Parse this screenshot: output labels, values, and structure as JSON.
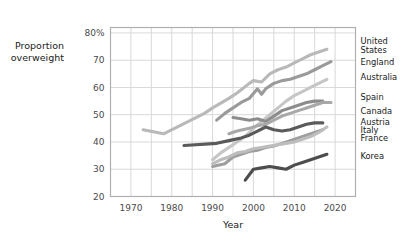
{
  "chart_data": {
    "type": "line",
    "title": "",
    "xlabel": "Year",
    "ylabel": "Proportion overweight",
    "ylabel_line1": "Proportion",
    "ylabel_line2": "overweight",
    "xlim": [
      1965,
      2025
    ],
    "ylim": [
      20,
      82
    ],
    "xticks": [
      1970,
      1980,
      1990,
      2000,
      2010,
      2020
    ],
    "xtick_labels": [
      "1970",
      "1980",
      "1990",
      "2000",
      "2010",
      "2020"
    ],
    "yticks": [
      20,
      30,
      40,
      50,
      60,
      70,
      80
    ],
    "ytick_labels": [
      "20",
      "30",
      "40",
      "50",
      "60",
      "70",
      "80%"
    ],
    "grid": true,
    "grid_minor_x": [
      1965,
      1970,
      1975,
      1980,
      1985,
      1990,
      1995,
      2000,
      2005,
      2010,
      2015,
      2020,
      2025
    ],
    "legend_position": "right-of-axes-at-line-end",
    "series": [
      {
        "name": "United States",
        "label_lines": [
          "United",
          "States"
        ],
        "color": "#b9b9b9",
        "label_y": 75.5,
        "x": [
          1973,
          1978,
          1988,
          1990,
          1994,
          1996,
          1999,
          2000,
          2002,
          2004,
          2006,
          2008,
          2010,
          2012,
          2014,
          2016,
          2018
        ],
        "values": [
          44.5,
          43.0,
          50.5,
          52.5,
          56.0,
          58.0,
          61.5,
          62.5,
          62.0,
          65.0,
          66.5,
          67.5,
          69.0,
          70.5,
          72.0,
          73.0,
          74.0
        ]
      },
      {
        "name": "England",
        "label_lines": [
          "England"
        ],
        "color": "#9a9a9a",
        "label_y": 69.5,
        "x": [
          1991,
          1993,
          1995,
          1997,
          1999,
          2001,
          2002,
          2003,
          2005,
          2007,
          2009,
          2011,
          2013,
          2015,
          2017,
          2019
        ],
        "values": [
          48.0,
          50.5,
          52.5,
          54.5,
          56.0,
          59.5,
          57.5,
          59.5,
          61.5,
          62.5,
          63.0,
          64.0,
          65.0,
          66.5,
          68.0,
          69.5
        ]
      },
      {
        "name": "Australia",
        "label_lines": [
          "Australia"
        ],
        "color": "#c6c6c6",
        "label_y": 64.0,
        "x": [
          1990,
          1992,
          1995,
          1998,
          2000,
          2002,
          2004,
          2006,
          2008,
          2010,
          2012,
          2014,
          2016,
          2018
        ],
        "values": [
          33.5,
          36.0,
          39.0,
          42.0,
          45.0,
          47.5,
          50.0,
          52.5,
          55.0,
          57.0,
          58.5,
          60.0,
          61.5,
          63.0
        ]
      },
      {
        "name": "Spain",
        "label_lines": [
          "Spain"
        ],
        "color": "#8c8c8c",
        "label_y": 56.5,
        "x": [
          1995,
          1997,
          1999,
          2001,
          2003,
          2005,
          2007,
          2009,
          2011,
          2013,
          2015,
          2017
        ],
        "values": [
          49.0,
          48.5,
          48.0,
          48.5,
          47.5,
          49.5,
          51.5,
          52.5,
          53.5,
          54.5,
          55.0,
          55.0
        ]
      },
      {
        "name": "Canada",
        "label_lines": [
          "Canada"
        ],
        "color": "#a8a8a8",
        "label_y": 51.5,
        "x": [
          1994,
          1996,
          1999,
          2001,
          2003,
          2005,
          2007,
          2009,
          2011,
          2013,
          2015,
          2017,
          2019
        ],
        "values": [
          43.0,
          44.0,
          45.0,
          46.0,
          46.5,
          48.0,
          49.5,
          50.5,
          51.5,
          52.5,
          53.5,
          54.5,
          54.5
        ]
      },
      {
        "name": "Austria",
        "label_lines": [
          "Austria"
        ],
        "color": "#5a5a5a",
        "label_y": 47.5,
        "x": [
          1983,
          1991,
          1994,
          1997,
          1999,
          2001,
          2003,
          2005,
          2007,
          2009,
          2011,
          2013,
          2015,
          2017
        ],
        "values": [
          38.7,
          39.5,
          40.5,
          41.5,
          42.5,
          44.0,
          45.5,
          44.5,
          44.0,
          44.5,
          45.5,
          46.5,
          47.0,
          47.0
        ]
      },
      {
        "name": "Italy",
        "label_lines": [
          "Italy"
        ],
        "color": "#9e9e9e",
        "label_y": 44.5,
        "x": [
          1990,
          1993,
          1995,
          1997,
          1999,
          2001,
          2003,
          2005,
          2007,
          2009,
          2011,
          2013,
          2015,
          2017
        ],
        "values": [
          31.0,
          32.0,
          34.5,
          35.5,
          36.5,
          37.0,
          38.0,
          38.5,
          39.5,
          40.5,
          41.5,
          42.5,
          43.5,
          44.5
        ]
      },
      {
        "name": "France",
        "label_lines": [
          "France"
        ],
        "color": "#bdbdbd",
        "label_y": 41.5,
        "x": [
          1990,
          1992,
          1994,
          1996,
          1998,
          2000,
          2002,
          2004,
          2006,
          2008,
          2010,
          2012,
          2014,
          2016,
          2018
        ],
        "values": [
          32.0,
          33.5,
          34.5,
          36.0,
          36.5,
          37.5,
          38.0,
          38.5,
          39.0,
          39.5,
          40.0,
          41.0,
          42.0,
          43.5,
          45.5
        ]
      },
      {
        "name": "Korea",
        "label_lines": [
          "Korea"
        ],
        "color": "#4d4d4d",
        "label_y": 35.0,
        "x": [
          1998,
          2000,
          2002,
          2004,
          2006,
          2008,
          2010,
          2012,
          2014,
          2016,
          2018
        ],
        "values": [
          26.0,
          30.0,
          30.5,
          31.0,
          30.5,
          30.0,
          31.5,
          32.5,
          33.5,
          34.5,
          35.5
        ]
      }
    ]
  }
}
